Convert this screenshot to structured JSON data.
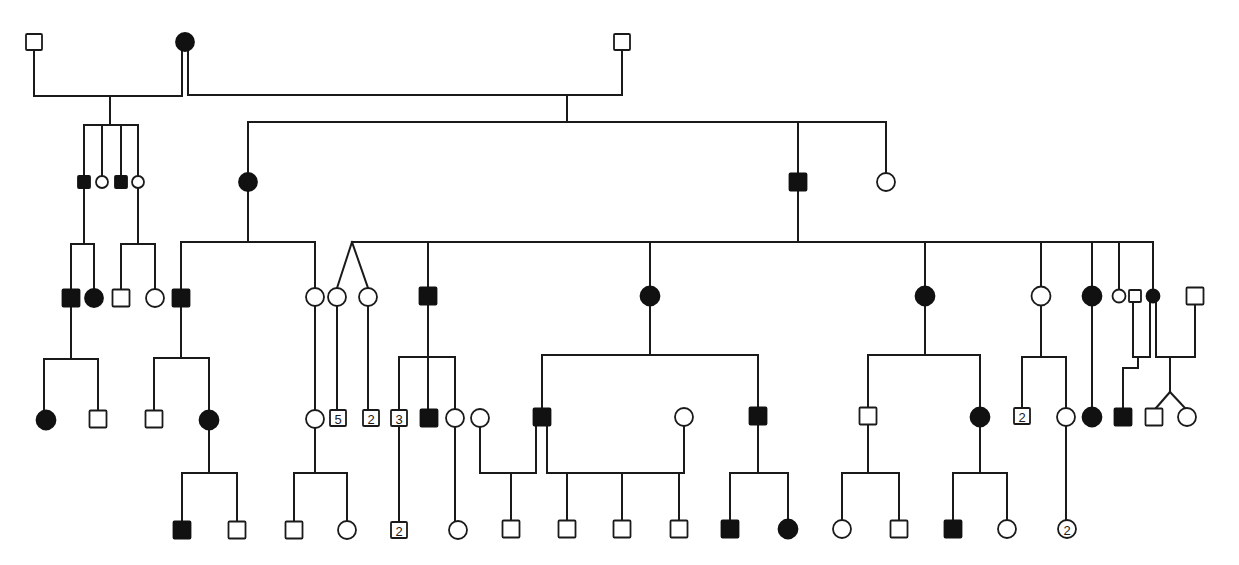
{
  "diagram": {
    "type": "pedigree-chart",
    "title": "",
    "colors": {
      "line": "#1a1a1a",
      "affected": "#111111",
      "unaffected": "#ffffff"
    },
    "symbol_legend": {
      "square": "male",
      "circle": "female",
      "filled": "affected",
      "open": "unaffected",
      "number_inside": "count of sibs of that sex"
    },
    "individuals": [
      {
        "id": "I-1",
        "gen": 1,
        "sex": "male",
        "affected": false,
        "x": 34,
        "y": 42,
        "size": 16
      },
      {
        "id": "I-2",
        "gen": 1,
        "sex": "female",
        "affected": true,
        "x": 185,
        "y": 42,
        "size": 18
      },
      {
        "id": "I-3",
        "gen": 1,
        "sex": "male",
        "affected": false,
        "x": 622,
        "y": 42,
        "size": 16
      },
      {
        "id": "II-1",
        "gen": 2,
        "sex": "male",
        "affected": true,
        "x": 84,
        "y": 182,
        "size": 12
      },
      {
        "id": "II-2",
        "gen": 2,
        "sex": "female",
        "affected": false,
        "x": 102,
        "y": 182,
        "size": 12
      },
      {
        "id": "II-3",
        "gen": 2,
        "sex": "male",
        "affected": true,
        "x": 121,
        "y": 182,
        "size": 12
      },
      {
        "id": "II-4",
        "gen": 2,
        "sex": "female",
        "affected": false,
        "x": 138,
        "y": 182,
        "size": 12
      },
      {
        "id": "II-5",
        "gen": 2,
        "sex": "female",
        "affected": true,
        "x": 248,
        "y": 182,
        "size": 18
      },
      {
        "id": "II-6",
        "gen": 2,
        "sex": "male",
        "affected": true,
        "x": 798,
        "y": 182,
        "size": 17
      },
      {
        "id": "II-7",
        "gen": 2,
        "sex": "female",
        "affected": false,
        "x": 886,
        "y": 182,
        "size": 18
      },
      {
        "id": "III-1",
        "gen": 3,
        "sex": "male",
        "affected": true,
        "x": 71,
        "y": 298,
        "size": 17
      },
      {
        "id": "III-2",
        "gen": 3,
        "sex": "female",
        "affected": true,
        "x": 94,
        "y": 298,
        "size": 18
      },
      {
        "id": "III-3",
        "gen": 3,
        "sex": "male",
        "affected": false,
        "x": 121,
        "y": 298,
        "size": 17
      },
      {
        "id": "III-4",
        "gen": 3,
        "sex": "female",
        "affected": false,
        "x": 155,
        "y": 298,
        "size": 18
      },
      {
        "id": "III-5",
        "gen": 3,
        "sex": "male",
        "affected": true,
        "x": 181,
        "y": 298,
        "size": 17
      },
      {
        "id": "III-6",
        "gen": 3,
        "sex": "female",
        "affected": false,
        "x": 315,
        "y": 297,
        "size": 18
      },
      {
        "id": "III-7",
        "gen": 3,
        "sex": "female",
        "affected": false,
        "x": 337,
        "y": 297,
        "size": 18
      },
      {
        "id": "III-8",
        "gen": 3,
        "sex": "female",
        "affected": false,
        "x": 368,
        "y": 297,
        "size": 18
      },
      {
        "id": "III-9",
        "gen": 3,
        "sex": "male",
        "affected": true,
        "x": 428,
        "y": 296,
        "size": 17
      },
      {
        "id": "III-10",
        "gen": 3,
        "sex": "female",
        "affected": true,
        "x": 650,
        "y": 296,
        "size": 19
      },
      {
        "id": "III-11",
        "gen": 3,
        "sex": "female",
        "affected": true,
        "x": 925,
        "y": 296,
        "size": 19
      },
      {
        "id": "III-12",
        "gen": 3,
        "sex": "female",
        "affected": false,
        "x": 1041,
        "y": 296,
        "size": 19
      },
      {
        "id": "III-13",
        "gen": 3,
        "sex": "female",
        "affected": true,
        "x": 1092,
        "y": 296,
        "size": 19
      },
      {
        "id": "III-14",
        "gen": 3,
        "sex": "female",
        "affected": false,
        "x": 1119,
        "y": 296,
        "size": 13
      },
      {
        "id": "III-15",
        "gen": 3,
        "sex": "male",
        "affected": false,
        "x": 1135,
        "y": 296,
        "size": 12
      },
      {
        "id": "III-16",
        "gen": 3,
        "sex": "female",
        "affected": true,
        "x": 1153,
        "y": 296,
        "size": 13
      },
      {
        "id": "III-17",
        "gen": 3,
        "sex": "male",
        "affected": false,
        "x": 1195,
        "y": 296,
        "size": 17
      },
      {
        "id": "IV-1",
        "gen": 4,
        "sex": "female",
        "affected": true,
        "x": 46,
        "y": 420,
        "size": 19
      },
      {
        "id": "IV-2",
        "gen": 4,
        "sex": "male",
        "affected": false,
        "x": 98,
        "y": 419,
        "size": 17
      },
      {
        "id": "IV-3",
        "gen": 4,
        "sex": "male",
        "affected": false,
        "x": 154,
        "y": 419,
        "size": 17
      },
      {
        "id": "IV-4",
        "gen": 4,
        "sex": "female",
        "affected": true,
        "x": 209,
        "y": 420,
        "size": 19
      },
      {
        "id": "IV-5",
        "gen": 4,
        "sex": "female",
        "affected": false,
        "x": 315,
        "y": 419,
        "size": 18
      },
      {
        "id": "IV-6",
        "gen": 4,
        "sex": "male",
        "affected": false,
        "x": 338,
        "y": 418,
        "size": 16,
        "count": "5"
      },
      {
        "id": "IV-7",
        "gen": 4,
        "sex": "male",
        "affected": false,
        "x": 371,
        "y": 418,
        "size": 16,
        "count": "2"
      },
      {
        "id": "IV-8",
        "gen": 4,
        "sex": "male",
        "affected": false,
        "x": 399,
        "y": 418,
        "size": 16,
        "count": "3"
      },
      {
        "id": "IV-9",
        "gen": 4,
        "sex": "male",
        "affected": true,
        "x": 429,
        "y": 418,
        "size": 17
      },
      {
        "id": "IV-10",
        "gen": 4,
        "sex": "female",
        "affected": false,
        "x": 455,
        "y": 418,
        "size": 18
      },
      {
        "id": "IV-11",
        "gen": 4,
        "sex": "female",
        "affected": false,
        "x": 480,
        "y": 418,
        "size": 18
      },
      {
        "id": "IV-12",
        "gen": 4,
        "sex": "male",
        "affected": true,
        "x": 542,
        "y": 417,
        "size": 17
      },
      {
        "id": "IV-13",
        "gen": 4,
        "sex": "female",
        "affected": false,
        "x": 684,
        "y": 417,
        "size": 18
      },
      {
        "id": "IV-14",
        "gen": 4,
        "sex": "male",
        "affected": true,
        "x": 758,
        "y": 416,
        "size": 17
      },
      {
        "id": "IV-15",
        "gen": 4,
        "sex": "male",
        "affected": false,
        "x": 868,
        "y": 416,
        "size": 17
      },
      {
        "id": "IV-16",
        "gen": 4,
        "sex": "female",
        "affected": true,
        "x": 980,
        "y": 417,
        "size": 19
      },
      {
        "id": "IV-17",
        "gen": 4,
        "sex": "male",
        "affected": false,
        "x": 1022,
        "y": 416,
        "size": 16,
        "count": "2"
      },
      {
        "id": "IV-18",
        "gen": 4,
        "sex": "female",
        "affected": false,
        "x": 1066,
        "y": 417,
        "size": 18
      },
      {
        "id": "IV-19",
        "gen": 4,
        "sex": "female",
        "affected": true,
        "x": 1092,
        "y": 417,
        "size": 19
      },
      {
        "id": "IV-20",
        "gen": 4,
        "sex": "male",
        "affected": true,
        "x": 1123,
        "y": 417,
        "size": 17
      },
      {
        "id": "IV-21",
        "gen": 4,
        "sex": "male",
        "affected": false,
        "x": 1154,
        "y": 417,
        "size": 17
      },
      {
        "id": "IV-22",
        "gen": 4,
        "sex": "female",
        "affected": false,
        "x": 1187,
        "y": 417,
        "size": 18
      },
      {
        "id": "V-1",
        "gen": 5,
        "sex": "male",
        "affected": true,
        "x": 182,
        "y": 530,
        "size": 17
      },
      {
        "id": "V-2",
        "gen": 5,
        "sex": "male",
        "affected": false,
        "x": 237,
        "y": 530,
        "size": 17
      },
      {
        "id": "V-3",
        "gen": 5,
        "sex": "male",
        "affected": false,
        "x": 294,
        "y": 530,
        "size": 17
      },
      {
        "id": "V-4",
        "gen": 5,
        "sex": "female",
        "affected": false,
        "x": 347,
        "y": 530,
        "size": 18
      },
      {
        "id": "V-5",
        "gen": 5,
        "sex": "male",
        "affected": false,
        "x": 399,
        "y": 530,
        "size": 16,
        "count": "2"
      },
      {
        "id": "V-6",
        "gen": 5,
        "sex": "female",
        "affected": false,
        "x": 458,
        "y": 530,
        "size": 18
      },
      {
        "id": "V-7",
        "gen": 5,
        "sex": "male",
        "affected": false,
        "x": 511,
        "y": 529,
        "size": 17
      },
      {
        "id": "V-8",
        "gen": 5,
        "sex": "male",
        "affected": false,
        "x": 567,
        "y": 529,
        "size": 17
      },
      {
        "id": "V-9",
        "gen": 5,
        "sex": "male",
        "affected": false,
        "x": 622,
        "y": 529,
        "size": 17
      },
      {
        "id": "V-10",
        "gen": 5,
        "sex": "male",
        "affected": false,
        "x": 679,
        "y": 529,
        "size": 17
      },
      {
        "id": "V-11",
        "gen": 5,
        "sex": "male",
        "affected": true,
        "x": 730,
        "y": 529,
        "size": 17
      },
      {
        "id": "V-12",
        "gen": 5,
        "sex": "female",
        "affected": true,
        "x": 788,
        "y": 529,
        "size": 19
      },
      {
        "id": "V-13",
        "gen": 5,
        "sex": "female",
        "affected": false,
        "x": 842,
        "y": 529,
        "size": 18
      },
      {
        "id": "V-14",
        "gen": 5,
        "sex": "male",
        "affected": false,
        "x": 899,
        "y": 529,
        "size": 17
      },
      {
        "id": "V-15",
        "gen": 5,
        "sex": "male",
        "affected": true,
        "x": 953,
        "y": 529,
        "size": 17
      },
      {
        "id": "V-16",
        "gen": 5,
        "sex": "female",
        "affected": false,
        "x": 1007,
        "y": 529,
        "size": 18
      },
      {
        "id": "V-17",
        "gen": 5,
        "sex": "female",
        "affected": false,
        "x": 1067,
        "y": 529,
        "size": 18,
        "count": "2"
      }
    ],
    "lines": [
      [
        34,
        50,
        34,
        96
      ],
      [
        34,
        96,
        182,
        96
      ],
      [
        182,
        96,
        182,
        51
      ],
      [
        188,
        51,
        188,
        95
      ],
      [
        188,
        95,
        622,
        95
      ],
      [
        622,
        50,
        622,
        95
      ],
      [
        110,
        96,
        110,
        125
      ],
      [
        84,
        125,
        138,
        125
      ],
      [
        84,
        125,
        84,
        176
      ],
      [
        102,
        125,
        102,
        176
      ],
      [
        121,
        125,
        121,
        176
      ],
      [
        138,
        125,
        138,
        176
      ],
      [
        567,
        95,
        567,
        122
      ],
      [
        248,
        122,
        886,
        122
      ],
      [
        248,
        122,
        248,
        173
      ],
      [
        798,
        122,
        798,
        173
      ],
      [
        886,
        122,
        886,
        173
      ],
      [
        84,
        188,
        84,
        244
      ],
      [
        71,
        244,
        94,
        244
      ],
      [
        71,
        244,
        71,
        289
      ],
      [
        94,
        244,
        94,
        289
      ],
      [
        138,
        188,
        138,
        244
      ],
      [
        121,
        244,
        155,
        244
      ],
      [
        121,
        244,
        121,
        289
      ],
      [
        155,
        244,
        155,
        289
      ],
      [
        248,
        191,
        248,
        242
      ],
      [
        181,
        242,
        315,
        242
      ],
      [
        181,
        242,
        181,
        289
      ],
      [
        315,
        242,
        315,
        288
      ],
      [
        798,
        191,
        798,
        242
      ],
      [
        352,
        242,
        1153,
        242
      ],
      [
        352,
        242,
        337,
        288
      ],
      [
        352,
        242,
        368,
        288
      ],
      [
        428,
        242,
        428,
        287
      ],
      [
        650,
        242,
        650,
        287
      ],
      [
        925,
        242,
        925,
        287
      ],
      [
        1041,
        242,
        1041,
        287
      ],
      [
        1092,
        242,
        1092,
        287
      ],
      [
        1119,
        242,
        1119,
        290
      ],
      [
        1153,
        242,
        1153,
        290
      ],
      [
        71,
        306,
        71,
        359
      ],
      [
        44,
        359,
        98,
        359
      ],
      [
        44,
        359,
        44,
        411
      ],
      [
        98,
        359,
        98,
        410
      ],
      [
        181,
        306,
        181,
        358
      ],
      [
        154,
        358,
        209,
        358
      ],
      [
        154,
        358,
        154,
        410
      ],
      [
        209,
        358,
        209,
        411
      ],
      [
        315,
        306,
        315,
        410
      ],
      [
        337,
        306,
        337,
        410
      ],
      [
        368,
        306,
        368,
        410
      ],
      [
        428,
        305,
        428,
        409
      ],
      [
        399,
        357,
        455,
        357
      ],
      [
        399,
        357,
        399,
        410
      ],
      [
        455,
        357,
        455,
        409
      ],
      [
        650,
        306,
        650,
        355
      ],
      [
        542,
        355,
        758,
        355
      ],
      [
        542,
        355,
        542,
        408
      ],
      [
        758,
        355,
        758,
        407
      ],
      [
        925,
        306,
        925,
        355
      ],
      [
        868,
        355,
        980,
        355
      ],
      [
        868,
        355,
        868,
        407
      ],
      [
        980,
        355,
        980,
        408
      ],
      [
        1041,
        306,
        1041,
        357
      ],
      [
        1022,
        357,
        1066,
        357
      ],
      [
        1022,
        357,
        1022,
        408
      ],
      [
        1066,
        357,
        1066,
        408
      ],
      [
        1092,
        306,
        1092,
        408
      ],
      [
        1133,
        302,
        1133,
        357
      ],
      [
        1150,
        302,
        1150,
        357
      ],
      [
        1133,
        357,
        1150,
        357
      ],
      [
        1138,
        357,
        1138,
        368
      ],
      [
        1123,
        368,
        1138,
        368
      ],
      [
        1123,
        368,
        1123,
        408
      ],
      [
        1156,
        302,
        1156,
        357
      ],
      [
        1156,
        357,
        1195,
        357
      ],
      [
        1195,
        305,
        1195,
        357
      ],
      [
        1170,
        357,
        1170,
        392
      ],
      [
        1170,
        392,
        1156,
        408
      ],
      [
        1170,
        392,
        1185,
        408
      ],
      [
        209,
        430,
        209,
        473
      ],
      [
        182,
        473,
        237,
        473
      ],
      [
        182,
        473,
        182,
        521
      ],
      [
        237,
        473,
        237,
        521
      ],
      [
        315,
        428,
        315,
        473
      ],
      [
        294,
        473,
        347,
        473
      ],
      [
        294,
        473,
        294,
        521
      ],
      [
        347,
        473,
        347,
        521
      ],
      [
        399,
        427,
        399,
        521
      ],
      [
        455,
        427,
        455,
        521
      ],
      [
        480,
        427,
        480,
        473
      ],
      [
        480,
        473,
        536,
        473
      ],
      [
        536,
        426,
        536,
        473
      ],
      [
        511,
        473,
        511,
        520
      ],
      [
        547,
        426,
        547,
        473
      ],
      [
        547,
        473,
        684,
        473
      ],
      [
        684,
        426,
        684,
        473
      ],
      [
        567,
        473,
        567,
        520
      ],
      [
        622,
        473,
        622,
        520
      ],
      [
        679,
        473,
        679,
        520
      ],
      [
        758,
        425,
        758,
        473
      ],
      [
        730,
        473,
        788,
        473
      ],
      [
        730,
        473,
        730,
        520
      ],
      [
        788,
        473,
        788,
        520
      ],
      [
        868,
        425,
        868,
        473
      ],
      [
        842,
        473,
        899,
        473
      ],
      [
        842,
        473,
        842,
        520
      ],
      [
        899,
        473,
        899,
        520
      ],
      [
        980,
        427,
        980,
        473
      ],
      [
        953,
        473,
        1007,
        473
      ],
      [
        953,
        473,
        953,
        520
      ],
      [
        1007,
        473,
        1007,
        520
      ],
      [
        1066,
        426,
        1066,
        520
      ]
    ]
  }
}
